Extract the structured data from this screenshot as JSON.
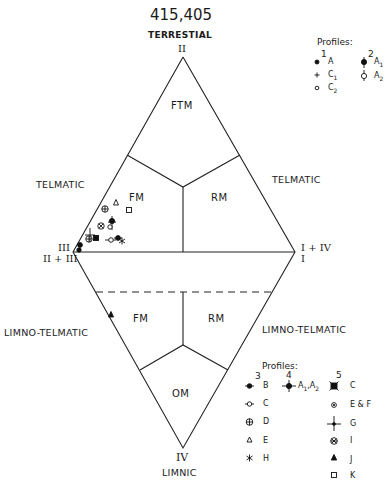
{
  "header": {
    "title": "415,405",
    "top_label": "TERRESTIAL"
  },
  "vertices": {
    "top": "II",
    "left_upper": "III",
    "left_lower": "II + III",
    "right_upper": "I + IV",
    "right_lower": "I",
    "bottom": "IV"
  },
  "side_labels": {
    "upper_left": "TELMATIC",
    "upper_right": "TELMATIC",
    "lower_left": "LIMNO-TELMATIC",
    "lower_right": "LIMNO-TELMATIC",
    "bottom": "LIMNIC"
  },
  "zones": {
    "ftm": "FTM",
    "fm_upper": "FM",
    "rm_upper": "RM",
    "fm_lower": "FM",
    "rm_lower": "RM",
    "om": "OM"
  },
  "legend_top": {
    "heading": "Profiles:",
    "col1_header": "1",
    "col2_header": "2",
    "col1": [
      {
        "symbol": "filled-dot",
        "label": "A"
      },
      {
        "symbol": "plus",
        "label": "C1"
      },
      {
        "symbol": "open-circle",
        "label": "C2"
      }
    ],
    "col2": [
      {
        "symbol": "filled-dot-vertical-bar",
        "label": "A1"
      },
      {
        "symbol": "open-circle-vertical-bar",
        "label": "A2"
      }
    ]
  },
  "legend_bottom": {
    "heading": "Profiles:",
    "col3_header": "3",
    "col4_header": "4",
    "col5_header": "5",
    "col3": [
      {
        "symbol": "filled-dot-horizontal-bar",
        "label": "B"
      },
      {
        "symbol": "open-circle-horizontal-bar",
        "label": "C"
      },
      {
        "symbol": "circle-cross",
        "label": "D"
      },
      {
        "symbol": "open-triangle",
        "label": "E"
      },
      {
        "symbol": "asterisk",
        "label": "H"
      }
    ],
    "col4": [
      {
        "symbol": "filled-dot-cross",
        "label": "A1,A2"
      }
    ],
    "col5": [
      {
        "symbol": "filled-square-x",
        "label": "C"
      },
      {
        "symbol": "dotted-circle",
        "label": "E & F"
      },
      {
        "symbol": "thin-cross",
        "label": "G"
      },
      {
        "symbol": "circle-x",
        "label": "I"
      },
      {
        "symbol": "filled-triangle",
        "label": "J"
      },
      {
        "symbol": "open-square",
        "label": "K"
      }
    ]
  },
  "plotted_points": [
    {
      "symbol": "circle-cross",
      "profile": "3-D",
      "x": 105,
      "y": 209
    },
    {
      "symbol": "open-triangle",
      "profile": "3-E",
      "x": 116,
      "y": 203
    },
    {
      "symbol": "open-square",
      "profile": "5-K",
      "x": 129,
      "y": 210
    },
    {
      "symbol": "circle-x",
      "profile": "5-I",
      "x": 101,
      "y": 226
    },
    {
      "symbol": "filled-dot-vertical-bar",
      "profile": "2-A1",
      "x": 112,
      "y": 222
    },
    {
      "symbol": "open-circle-vertical-bar",
      "profile": "2-A2",
      "x": 110,
      "y": 226
    },
    {
      "symbol": "thin-cross",
      "profile": "5-G",
      "x": 90,
      "y": 235
    },
    {
      "symbol": "circle-cross",
      "profile": "3-D",
      "x": 89,
      "y": 238
    },
    {
      "symbol": "filled-square-x",
      "profile": "5-C",
      "x": 96,
      "y": 238
    },
    {
      "symbol": "open-circle-horizontal-bar",
      "profile": "3-C",
      "x": 112,
      "y": 239
    },
    {
      "symbol": "filled-dot-horizontal-bar",
      "profile": "3-B",
      "x": 118,
      "y": 237
    },
    {
      "symbol": "asterisk",
      "profile": "3-H",
      "x": 122,
      "y": 241
    },
    {
      "symbol": "filled-dot",
      "profile": "1-A",
      "x": 80,
      "y": 245
    },
    {
      "symbol": "filled-dot",
      "profile": "1-A",
      "x": 79,
      "y": 250
    },
    {
      "symbol": "filled-triangle",
      "profile": "5-J",
      "x": 111,
      "y": 315
    }
  ]
}
